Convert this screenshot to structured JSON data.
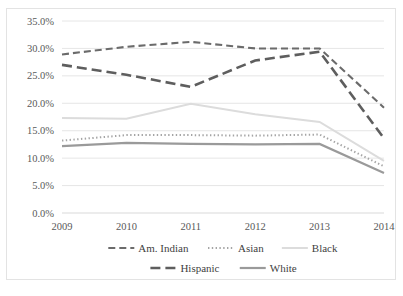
{
  "chart_data": {
    "type": "line",
    "title": "",
    "xlabel": "",
    "ylabel": "",
    "categories": [
      "2009",
      "2010",
      "2011",
      "2012",
      "2013",
      "2014"
    ],
    "x": [
      2009,
      2010,
      2011,
      2012,
      2013,
      2014
    ],
    "ylim": [
      0,
      35
    ],
    "yticks": [
      0,
      5,
      10,
      15,
      20,
      25,
      30,
      35
    ],
    "ytick_labels": [
      "0.0%",
      "5.0%",
      "10.0%",
      "15.0%",
      "20.0%",
      "25.0%",
      "30.0%",
      "35.0%"
    ],
    "grid": true,
    "legend_position": "bottom",
    "value_suffix": "%",
    "series": [
      {
        "name": "Am. Indian",
        "values": [
          28.9,
          30.3,
          31.2,
          30.0,
          30.0,
          19.2
        ],
        "color": "#6b6b6b",
        "dash": "7,4",
        "width": 2.1
      },
      {
        "name": "Asian",
        "values": [
          13.2,
          14.2,
          14.2,
          14.1,
          14.3,
          8.5
        ],
        "color": "#a5a5a5",
        "dash": "1.4,2.4",
        "width": 2.0
      },
      {
        "name": "Black",
        "values": [
          17.3,
          17.2,
          19.9,
          18.0,
          16.6,
          9.5
        ],
        "color": "#dcdcdc",
        "dash": "none",
        "width": 2.0
      },
      {
        "name": "Hispanic",
        "values": [
          27.0,
          25.2,
          23.0,
          27.8,
          29.4,
          13.6
        ],
        "color": "#5e5e5e",
        "dash": "10,5",
        "width": 2.6
      },
      {
        "name": "White",
        "values": [
          12.2,
          12.8,
          12.6,
          12.5,
          12.6,
          7.3
        ],
        "color": "#9a9a9a",
        "dash": "none",
        "width": 2.2
      }
    ]
  },
  "legend": {
    "row1": [
      "Am. Indian",
      "Asian",
      "Black"
    ],
    "row2": [
      "Hispanic",
      "White"
    ]
  },
  "colors": {
    "background": "#ffffff",
    "frame": "#e3e3e3",
    "gridline": "#e0e0e0",
    "tick_text": "#595959",
    "legend_text": "#3f3f3f"
  }
}
